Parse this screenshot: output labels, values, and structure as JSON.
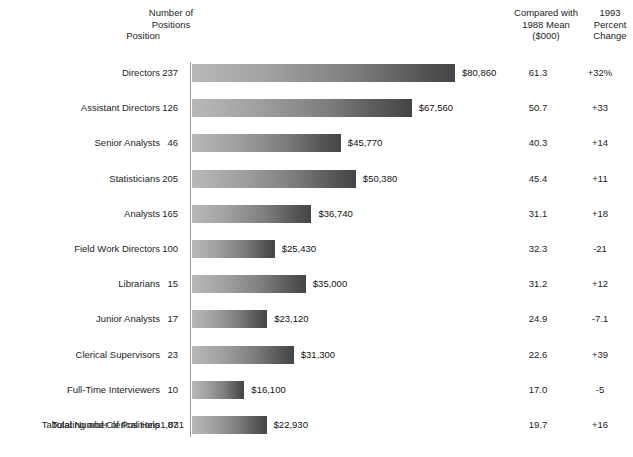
{
  "headers": {
    "position": "Position",
    "count": "Number of\nPositions",
    "compare": "Compared with\n1988 Mean\n($000)",
    "percent": "1993\nPercent\nChange"
  },
  "total": {
    "label": "Total Number of Positions",
    "value": "1,031"
  },
  "style": {
    "bar_light": "#b8b8b8",
    "bar_dark": "#454545",
    "axis_color": "#9a9a9a",
    "text_color": "#1d1d1d"
  },
  "chart_data": {
    "type": "bar",
    "title": "",
    "xlabel": "",
    "ylabel": "Position",
    "orientation": "horizontal",
    "grid": false,
    "legend": "none",
    "xlim": [
      0,
      80860
    ],
    "categories": [
      "Directors",
      "Assistant Directors",
      "Senior Analysts",
      "Statisticians",
      "Analysts",
      "Field Work Directors",
      "Librarians",
      "Junior Analysts",
      "Clerical Supervisors",
      "Full-Time Interviewers",
      "Tabulating and Clerical Help"
    ],
    "values": [
      80860,
      67560,
      45770,
      50380,
      36740,
      25430,
      35000,
      23120,
      31300,
      16100,
      22930
    ],
    "value_labels": [
      "$80,860",
      "$67,560",
      "$45,770",
      "$50,380",
      "$36,740",
      "$25,430",
      "$35,000",
      "$23,120",
      "$31,300",
      "$16,100",
      "$22,930"
    ],
    "number_of_positions": [
      "237",
      "126",
      "46",
      "205",
      "165",
      "100",
      "15",
      "17",
      "23",
      "10",
      "87"
    ],
    "compared_with_1988_mean": [
      "61.3",
      "50.7",
      "40.3",
      "45.4",
      "31.1",
      "32.3",
      "31.2",
      "24.9",
      "22.6",
      "17.0",
      "19.7"
    ],
    "percent_change_1993": [
      "+32%",
      "+33",
      "+14",
      "+11",
      "+18",
      "-21",
      "+12",
      "-7.1",
      "+39",
      "-5",
      "+16"
    ]
  }
}
